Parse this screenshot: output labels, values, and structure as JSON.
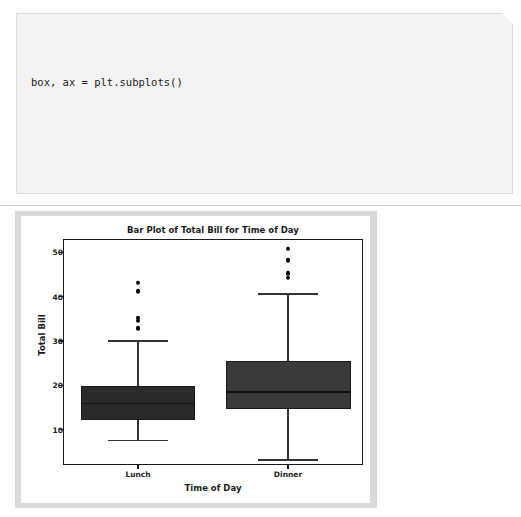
{
  "code": {
    "lines": [
      "box, ax = plt.subplots()",
      "",
      "sns.boxplot(data=tips, x='time', y='total_bill', ax=ax)",
      "",
      "ax.set_title('Bar Plot of Total Bill for Time of Day')",
      "ax.set_xlabel('Time of Day')",
      "ax.set_ylabel('Total Bill')",
      "",
      "plt.show()"
    ]
  },
  "chart_data": {
    "type": "box",
    "title": "Bar Plot of Total Bill for Time of Day",
    "xlabel": "Time of Day",
    "ylabel": "Total Bill",
    "categories": [
      "Lunch",
      "Dinner"
    ],
    "yticks": [
      10,
      20,
      30,
      40,
      50
    ],
    "ytick_labels": [
      "10",
      "20",
      "30",
      "40",
      "50"
    ],
    "ylim": [
      2.0,
      53.0
    ],
    "grid": false,
    "legend": null,
    "boxes": [
      {
        "name": "Lunch",
        "whisker_low": 7.5,
        "q1": 12.2,
        "median": 15.9,
        "q3": 19.8,
        "whisker_high": 30.0,
        "outliers": [
          32.9,
          34.6,
          35.2,
          41.2,
          43.1
        ],
        "fill": "#2a2a2a"
      },
      {
        "name": "Dinner",
        "whisker_low": 3.1,
        "q1": 14.6,
        "median": 18.5,
        "q3": 25.4,
        "whisker_high": 40.6,
        "outliers": [
          44.3,
          45.3,
          48.2,
          50.8
        ],
        "fill": "#3a3a3a"
      }
    ]
  },
  "colors": {
    "code_background": "#f3f3f3",
    "code_border": "#dcdcdc",
    "figure_matte": "#d9d9d9",
    "figure_canvas": "#ffffff",
    "axis_line": "#1a1a1a",
    "divider": "#cfcfcf"
  }
}
